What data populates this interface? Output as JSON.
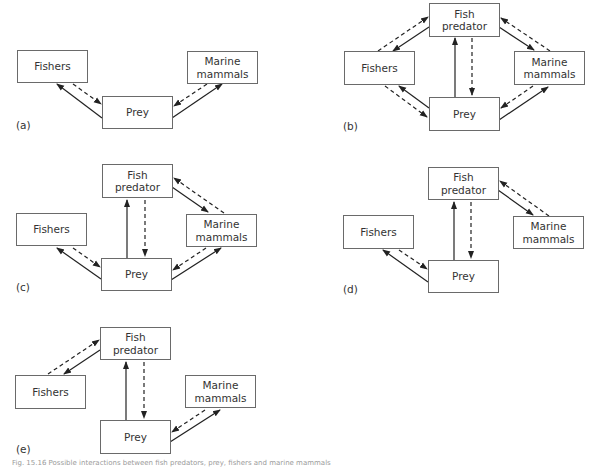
{
  "figure": {
    "caption": "Fig. 15.16 Possible interactions between fish predators, prey, fishers and marine mammals",
    "legend_hint": {
      "solid_arrow": "direct effect / flow",
      "dashed_arrow": "reciprocal effect"
    },
    "colors": {
      "line": "#222222",
      "box_border": "#6a6a6a",
      "text": "#333333"
    }
  },
  "nodes": {
    "fishers": "Fishers",
    "marine_mammals": "Marine\nmammals",
    "prey": "Prey",
    "fish_predator": "Fish\npredator"
  },
  "panels": [
    {
      "label": "(a)",
      "nodes": [
        "fishers",
        "prey",
        "marine_mammals"
      ],
      "links": [
        {
          "from": "prey",
          "to": "fishers",
          "style": "solid"
        },
        {
          "from": "fishers",
          "to": "prey",
          "style": "dashed"
        },
        {
          "from": "prey",
          "to": "marine_mammals",
          "style": "solid"
        },
        {
          "from": "marine_mammals",
          "to": "prey",
          "style": "dashed"
        }
      ]
    },
    {
      "label": "(b)",
      "nodes": [
        "fish_predator",
        "fishers",
        "marine_mammals",
        "prey"
      ],
      "links": [
        {
          "from": "fish_predator",
          "to": "fishers",
          "style": "solid"
        },
        {
          "from": "fishers",
          "to": "fish_predator",
          "style": "dashed"
        },
        {
          "from": "fish_predator",
          "to": "marine_mammals",
          "style": "solid"
        },
        {
          "from": "marine_mammals",
          "to": "fish_predator",
          "style": "dashed"
        },
        {
          "from": "prey",
          "to": "fish_predator",
          "style": "solid"
        },
        {
          "from": "fish_predator",
          "to": "prey",
          "style": "dashed"
        },
        {
          "from": "prey",
          "to": "fishers",
          "style": "solid"
        },
        {
          "from": "fishers",
          "to": "prey",
          "style": "dashed"
        },
        {
          "from": "prey",
          "to": "marine_mammals",
          "style": "solid"
        },
        {
          "from": "marine_mammals",
          "to": "prey",
          "style": "dashed"
        }
      ]
    },
    {
      "label": "(c)",
      "nodes": [
        "fish_predator",
        "fishers",
        "marine_mammals",
        "prey"
      ],
      "links": [
        {
          "from": "fish_predator",
          "to": "marine_mammals",
          "style": "solid"
        },
        {
          "from": "marine_mammals",
          "to": "fish_predator",
          "style": "dashed"
        },
        {
          "from": "prey",
          "to": "fish_predator",
          "style": "solid"
        },
        {
          "from": "fish_predator",
          "to": "prey",
          "style": "dashed"
        },
        {
          "from": "prey",
          "to": "fishers",
          "style": "solid"
        },
        {
          "from": "fishers",
          "to": "prey",
          "style": "dashed"
        },
        {
          "from": "prey",
          "to": "marine_mammals",
          "style": "solid"
        },
        {
          "from": "marine_mammals",
          "to": "prey",
          "style": "dashed"
        }
      ]
    },
    {
      "label": "(d)",
      "nodes": [
        "fish_predator",
        "fishers",
        "marine_mammals",
        "prey"
      ],
      "links": [
        {
          "from": "fish_predator",
          "to": "marine_mammals",
          "style": "solid"
        },
        {
          "from": "marine_mammals",
          "to": "fish_predator",
          "style": "dashed"
        },
        {
          "from": "prey",
          "to": "fish_predator",
          "style": "solid"
        },
        {
          "from": "fish_predator",
          "to": "prey",
          "style": "dashed"
        },
        {
          "from": "prey",
          "to": "fishers",
          "style": "solid"
        },
        {
          "from": "fishers",
          "to": "prey",
          "style": "dashed"
        }
      ]
    },
    {
      "label": "(e)",
      "nodes": [
        "fish_predator",
        "fishers",
        "marine_mammals",
        "prey"
      ],
      "links": [
        {
          "from": "fish_predator",
          "to": "fishers",
          "style": "solid"
        },
        {
          "from": "fishers",
          "to": "fish_predator",
          "style": "dashed"
        },
        {
          "from": "prey",
          "to": "fish_predator",
          "style": "solid"
        },
        {
          "from": "fish_predator",
          "to": "prey",
          "style": "dashed"
        },
        {
          "from": "prey",
          "to": "marine_mammals",
          "style": "solid"
        },
        {
          "from": "marine_mammals",
          "to": "prey",
          "style": "dashed"
        }
      ]
    }
  ]
}
